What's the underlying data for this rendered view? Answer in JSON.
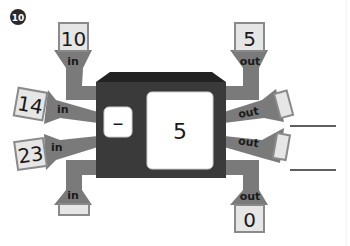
{
  "problem": {
    "number": "10",
    "badge_color": "#2a2a2a"
  },
  "machine": {
    "operation": "–",
    "operand": "5",
    "body_color": "#3a3a3a",
    "window_color": "#ffffff"
  },
  "colors": {
    "pipe": "#7a7a7a",
    "box_fill": "#e6e6e6",
    "box_border": "#8a8a8a"
  },
  "inputs": [
    {
      "id": "top-left",
      "label": "in",
      "value": "10"
    },
    {
      "id": "left-upper",
      "label": "in",
      "value": "14"
    },
    {
      "id": "left-lower",
      "label": "in",
      "value": "23"
    },
    {
      "id": "bottom-left",
      "label": "in",
      "value": ""
    }
  ],
  "outputs": [
    {
      "id": "top-right",
      "label": "out",
      "value": "5"
    },
    {
      "id": "right-upper",
      "label": "out",
      "value": ""
    },
    {
      "id": "right-lower",
      "label": "out",
      "value": ""
    },
    {
      "id": "bottom-right",
      "label": "out",
      "value": "0"
    }
  ],
  "answer_lines": [
    {
      "id": "answer-line-1",
      "value": ""
    },
    {
      "id": "answer-line-2",
      "value": ""
    }
  ]
}
